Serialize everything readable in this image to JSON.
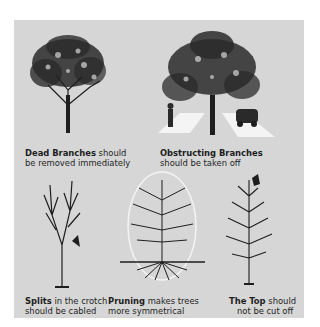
{
  "colors": {
    "page_background": "#ffffff",
    "panel_background": "#d6d6d6",
    "ink": "#1e1e1e",
    "highlight": "#f4f4f4"
  },
  "panels": [
    {
      "id": "dead-branches",
      "title": "Dead Branches",
      "rest_line1": " should",
      "line2": "be removed immediately",
      "icon": "full-leafy-tree"
    },
    {
      "id": "obstructing-branches",
      "title": "Obstructing Branches",
      "rest_line1": "",
      "line2": "should be taken off",
      "icon": "tree-over-sidewalk-and-road"
    },
    {
      "id": "splits",
      "title": "Splits",
      "rest_line1": " in the crotch",
      "line2": "should  be  cabled",
      "icon": "bare-split-tree"
    },
    {
      "id": "pruning",
      "title": "Pruning",
      "rest_line1": " makes trees",
      "line2": "more symmetrical",
      "icon": "pruned-tree-with-roots-oval"
    },
    {
      "id": "the-top",
      "title": "The Top",
      "rest_line1": " should",
      "line2": "not be cut off",
      "icon": "young-tree-with-top"
    }
  ]
}
